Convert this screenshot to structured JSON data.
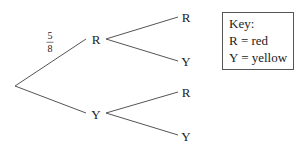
{
  "diagram": {
    "type": "probability-tree",
    "root": {
      "x": 15,
      "y": 86
    },
    "level1": [
      {
        "label": "R",
        "x": 96,
        "y": 39,
        "edge_label": {
          "numerator": "5",
          "denominator": "8"
        }
      },
      {
        "label": "Y",
        "x": 96,
        "y": 113,
        "edge_label": null
      }
    ],
    "level2": [
      {
        "parent": "R",
        "label": "R",
        "x": 185,
        "y": 17
      },
      {
        "parent": "R",
        "label": "Y",
        "x": 185,
        "y": 60
      },
      {
        "parent": "Y",
        "label": "R",
        "x": 185,
        "y": 92
      },
      {
        "parent": "Y",
        "label": "Y",
        "x": 185,
        "y": 135
      }
    ],
    "line_color": "#555555"
  },
  "key": {
    "title": "Key:",
    "entries": [
      {
        "symbol": "R",
        "meaning": "red",
        "text": "R = red"
      },
      {
        "symbol": "Y",
        "meaning": "yellow",
        "text": "Y = yellow"
      }
    ]
  },
  "labels": {
    "l1_r": "R",
    "l1_y": "Y",
    "l2_rr": "R",
    "l2_ry": "Y",
    "l2_yr": "R",
    "l2_yy": "Y",
    "frac_num": "5",
    "frac_den": "8"
  }
}
